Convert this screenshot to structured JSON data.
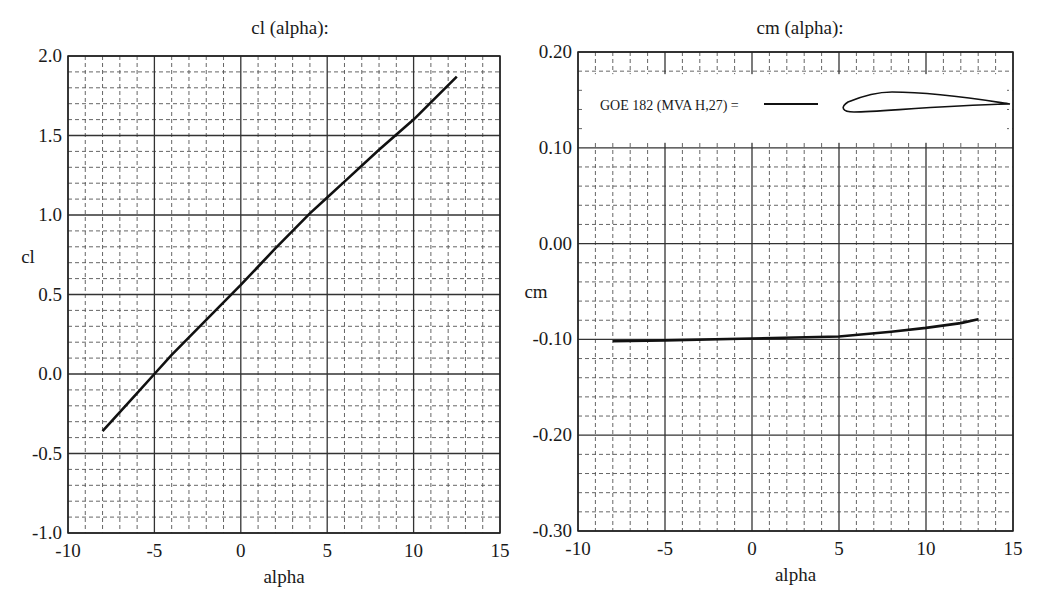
{
  "chart_data": [
    {
      "type": "line",
      "title": "cl (alpha):",
      "xlabel": "alpha",
      "ylabel": "cl",
      "xlim": [
        -10,
        15
      ],
      "ylim": [
        -1.0,
        2.0
      ],
      "xticks": [
        "-10",
        "-5",
        "0",
        "5",
        "10",
        "15"
      ],
      "yticks": [
        "-1.0",
        "-0.5",
        "0.0",
        "0.5",
        "1.0",
        "1.5",
        "2.0"
      ],
      "grid": {
        "major": true,
        "minor_dashed": true,
        "minor_x_step": 1,
        "minor_y_step": 0.1
      },
      "series": [
        {
          "name": "cl",
          "x": [
            -8,
            -6,
            -5,
            -4,
            -2,
            0,
            2,
            4,
            5,
            6,
            8,
            10,
            12.5
          ],
          "y": [
            -0.36,
            -0.12,
            0.0,
            0.12,
            0.34,
            0.56,
            0.79,
            1.01,
            1.11,
            1.21,
            1.41,
            1.6,
            1.87
          ]
        }
      ]
    },
    {
      "type": "line",
      "title": "cm (alpha):",
      "xlabel": "alpha",
      "ylabel": "cm",
      "xlim": [
        -10,
        15
      ],
      "ylim": [
        -0.3,
        0.2
      ],
      "xticks": [
        "-10",
        "-5",
        "0",
        "5",
        "10",
        "15"
      ],
      "yticks": [
        "-0.30",
        "-0.20",
        "-0.10",
        "0.00",
        "0.10",
        "0.20"
      ],
      "grid": {
        "major": true,
        "minor_dashed": true,
        "minor_x_step": 1,
        "minor_y_step": 0.02
      },
      "legend": {
        "label": "GOE 182 (MVA H,27) =",
        "shows_airfoil_profile": true,
        "position": "top"
      },
      "series": [
        {
          "name": "GOE 182 (MVA H,27)",
          "x": [
            -8,
            -5,
            0,
            5,
            8,
            10,
            12,
            13
          ],
          "y": [
            -0.102,
            -0.101,
            -0.099,
            -0.097,
            -0.092,
            -0.088,
            -0.083,
            -0.079
          ]
        }
      ]
    }
  ]
}
